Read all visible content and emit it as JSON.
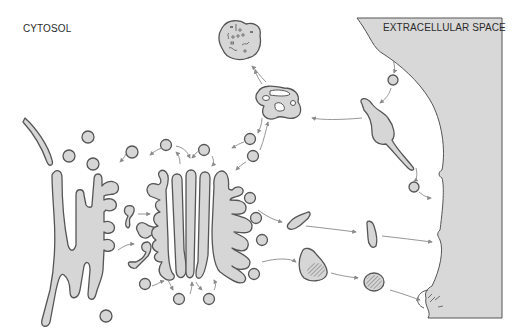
{
  "diagram": {
    "labels": {
      "cytosol": "CYTOSOL",
      "extracellular": "EXTRACELLULAR SPACE"
    },
    "compartments": [
      {
        "id": "nuclear-envelope",
        "description": "curved membrane at left"
      },
      {
        "id": "endoplasmic-reticulum",
        "description": "branched tubular network"
      },
      {
        "id": "golgi-stack",
        "description": "stacked cisternae with budding vesicles"
      },
      {
        "id": "lysosome",
        "description": "vacuole with contents, top"
      },
      {
        "id": "late-endosome",
        "description": "perforated compartment"
      },
      {
        "id": "early-endosome",
        "description": "tubular elongated compartment"
      },
      {
        "id": "secretory-vesicles",
        "description": "vesicles heading to plasma membrane"
      },
      {
        "id": "secretory-granule",
        "description": "hatched dense-core vesicle"
      },
      {
        "id": "plasma-membrane",
        "description": "wavy right boundary"
      }
    ],
    "colors": {
      "membrane_fill": "#d6d6d6",
      "membrane_stroke": "#555555",
      "arrow": "#8a8a8a",
      "extracellular_fill": "#d8d8d8",
      "text": "#2b2b2b"
    }
  }
}
